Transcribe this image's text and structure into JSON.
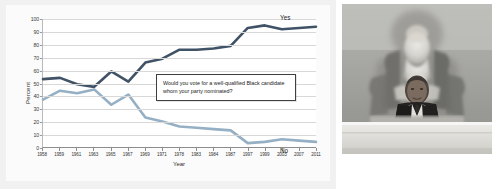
{
  "chart_data": {
    "type": "line",
    "title": "",
    "xlabel": "Year",
    "ylabel": "Percent",
    "ylim": [
      0,
      100
    ],
    "ytick_step": 10,
    "grid": true,
    "legend": "inline-end-labels",
    "annotation": "Would you vote for a well-qualified Black candidate whom your party nominated?",
    "categories": [
      "1958",
      "1959",
      "1961",
      "1963",
      "1965",
      "1967",
      "1969",
      "1971",
      "1978",
      "1983",
      "1984",
      "1987",
      "1997",
      "1999",
      "2003",
      "2007",
      "2011"
    ],
    "series": [
      {
        "name": "Yes",
        "color": "#3f5266",
        "values": [
          53,
          54,
          49,
          47,
          59,
          51,
          66,
          69,
          76,
          76,
          77,
          79,
          93,
          95,
          92,
          93,
          94
        ]
      },
      {
        "name": "No",
        "color": "#95afc4",
        "values": [
          37,
          44,
          42,
          45,
          33,
          41,
          23,
          20,
          16,
          15,
          14,
          13,
          3,
          4,
          6,
          5,
          4
        ]
      }
    ],
    "ytick_labels": [
      "0",
      "10",
      "20",
      "30",
      "40",
      "50",
      "60",
      "70",
      "80",
      "90",
      "100"
    ]
  },
  "photo": {
    "alt_name": "black-and-white-photo-speaker-at-lincoln-memorial",
    "caption": ""
  }
}
